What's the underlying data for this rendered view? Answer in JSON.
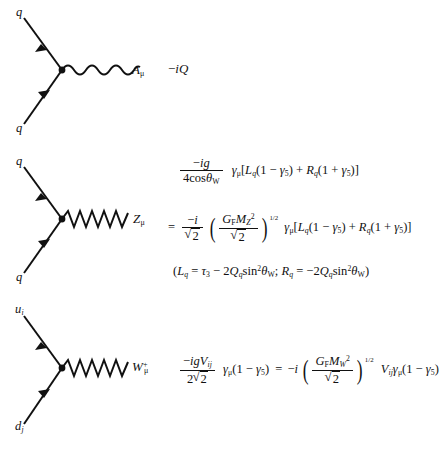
{
  "page": {
    "background": "#ffffff",
    "ink": "#111111",
    "width": 444,
    "height": 450
  },
  "vertices": [
    {
      "id": "photon",
      "name": "quark-photon-vertex",
      "incoming_label": "q",
      "outgoing_label": "q",
      "boson_label": "A",
      "boson_sub": "μ",
      "boson_sup": "",
      "boson_line_style": "wavy",
      "factor": {
        "lead": "−iQ",
        "lead_sub": "q",
        "tail": "γ",
        "tail_sub": "μ"
      }
    },
    {
      "id": "zboson",
      "name": "quark-z-vertex",
      "incoming_label": "q",
      "outgoing_label": "q",
      "boson_label": "Z",
      "boson_sub": "μ",
      "boson_sup": "",
      "boson_line_style": "zigzag"
    },
    {
      "id": "wboson",
      "name": "quark-w-vertex",
      "incoming_label": "u",
      "incoming_sub": "i",
      "outgoing_label": "d",
      "outgoing_sub": "j",
      "boson_label": "W",
      "boson_sub": "μ",
      "boson_sup": "+",
      "boson_line_style": "zigzag"
    }
  ],
  "formulas": {
    "photon": {
      "text": "−iQ_q γ_μ"
    },
    "z_line1": {
      "num": "−ig",
      "den_prefix": "4cos",
      "den_theta": "θ",
      "den_theta_sub": "W",
      "gamma": "γ",
      "gamma_sub": "μ",
      "bracket": "[L_q(1 − γ₅) + R_q(1 + γ₅)]",
      "L": "L",
      "L_sub": "q",
      "R": "R",
      "R_sub": "q",
      "gamma5": "γ",
      "gamma5_sub": "5",
      "minus": "−",
      "plus": "+"
    },
    "z_line2": {
      "equals": "=",
      "num": "−i",
      "den": "2",
      "G": "G",
      "G_sub": "F",
      "M": "M",
      "M_sub": "Z",
      "M_sup": "2",
      "inner_den": "2",
      "exponent": "1/2",
      "gamma": "γ",
      "gamma_sub": "μ"
    },
    "z_line3": {
      "text": "(L_q = τ₃ − 2Q_q sin²θ_W;  R_q = −2Q_q sin²θ_W)",
      "L": "L",
      "L_sub": "q",
      "tau": "τ",
      "tau_sub": "3",
      "Q": "Q",
      "Q_sub": "q",
      "sin": "sin",
      "sin_sup": "2",
      "theta": "θ",
      "theta_sub": "W",
      "R": "R",
      "R_sub": "q",
      "semicolon": ";"
    },
    "w_line": {
      "num": "−igV",
      "num_sub": "ij",
      "den_coef": "2",
      "den_root": "2",
      "gamma": "γ",
      "gamma_sub": "μ",
      "paren_left": "(1 − γ",
      "gamma5_sub": "5",
      "paren_right": ")",
      "equals": "=",
      "minus_i": "−i",
      "G": "G",
      "G_sub": "F",
      "M": "M",
      "M_sub": "W",
      "M_sup": "2",
      "inner_den": "2",
      "exponent": "1/2",
      "V": "V",
      "V_sub": "ij"
    }
  }
}
